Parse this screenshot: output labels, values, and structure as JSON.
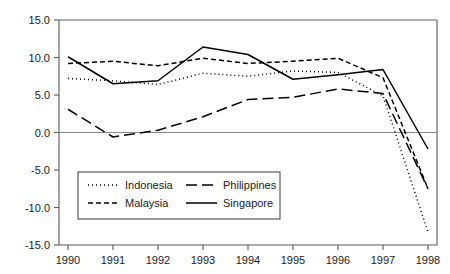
{
  "chart_data": {
    "type": "line",
    "title": "",
    "subtitle": "",
    "xlabel": "",
    "ylabel": "",
    "categories": [
      "1990",
      "1991",
      "1992",
      "1993",
      "1994",
      "1995",
      "1996",
      "1997",
      "1998"
    ],
    "x": [
      1990,
      1991,
      1992,
      1993,
      1994,
      1995,
      1996,
      1997,
      1998
    ],
    "ylim": [
      -15.0,
      15.0
    ],
    "ytick_labels": [
      "15.0",
      "10.0",
      "5.0",
      "0.0",
      "-5.0",
      "-10.0",
      "-15.0"
    ],
    "ytick_values": [
      15.0,
      10.0,
      5.0,
      0.0,
      -5.0,
      -10.0,
      -15.0
    ],
    "xtick_labels": [
      "1990",
      "1991",
      "1992",
      "1993",
      "1994",
      "1995",
      "1996",
      "1997",
      "1998"
    ],
    "grid": false,
    "zero_line": true,
    "legend_position": "inside-lower-left",
    "series": [
      {
        "name": "Indonesia",
        "style": "dotted",
        "dash": "1,3",
        "color": "#000000",
        "values": [
          7.2,
          6.9,
          6.4,
          7.9,
          7.5,
          8.2,
          8.0,
          4.9,
          -13.3
        ]
      },
      {
        "name": "Malaysia",
        "style": "short-dashed",
        "dash": "5,3",
        "color": "#000000",
        "values": [
          9.2,
          9.5,
          8.9,
          9.9,
          9.2,
          9.5,
          9.9,
          7.3,
          -7.5
        ]
      },
      {
        "name": "Philippines",
        "style": "long-dashed",
        "dash": "11,5",
        "color": "#000000",
        "values": [
          3.1,
          -0.6,
          0.3,
          2.1,
          4.4,
          4.7,
          5.8,
          5.2,
          -7.5
        ]
      },
      {
        "name": "Singapore",
        "style": "solid",
        "dash": "",
        "color": "#000000",
        "values": [
          10.1,
          6.5,
          6.9,
          11.4,
          10.4,
          7.1,
          7.7,
          8.4,
          -2.2
        ]
      }
    ],
    "legend_entries": [
      {
        "label": "Indonesia",
        "dash": "1,3"
      },
      {
        "label": "Philippines",
        "dash": "11,5"
      },
      {
        "label": "Malaysia",
        "dash": "5,3"
      },
      {
        "label": "Singapore",
        "dash": ""
      }
    ]
  }
}
